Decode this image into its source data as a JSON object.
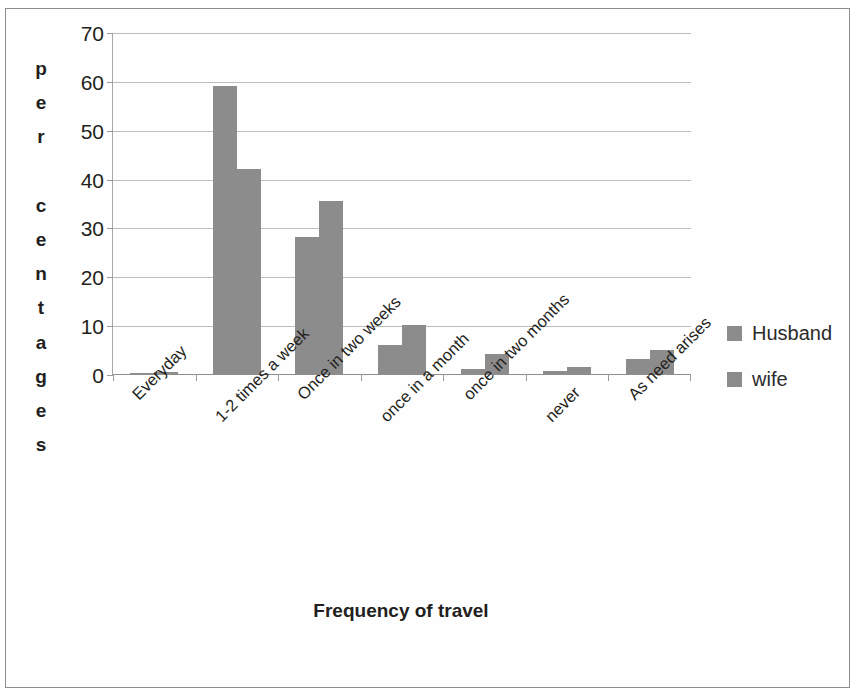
{
  "chart_data": {
    "type": "bar",
    "title": "",
    "xlabel": "Frequency of travel",
    "ylabel": "percentages",
    "ylabel_letters": "p\ne\nr\n \nc\ne\nn\nt\na\ng\ne\ns",
    "categories": [
      "Everyday",
      "1-2 times a week",
      "Once in two weeks",
      "once in a month",
      "once in two months",
      "never",
      "As need arises"
    ],
    "series": [
      {
        "name": "Husband",
        "values": [
          0.3,
          59,
          28,
          6,
          1,
          0.7,
          3
        ],
        "color": "#8c8c8c"
      },
      {
        "name": "wife",
        "values": [
          0.5,
          42,
          35.5,
          10,
          4,
          1.5,
          5
        ],
        "color": "#8c8c8c"
      }
    ],
    "ylim": [
      0,
      70
    ],
    "yticks": [
      0,
      10,
      20,
      30,
      40,
      50,
      60,
      70
    ],
    "ytick_labels": [
      "0",
      "10",
      "20",
      "30",
      "40",
      "50",
      "60",
      "70"
    ],
    "grid": true,
    "grid_axis": "y",
    "legend_position": "right",
    "bar_gap_ratio": 0.42,
    "background": "#ffffff",
    "gridline_color": "#bdbdbd",
    "axis_color": "#8f8f8f",
    "text_color": "#231f20"
  },
  "legend": {
    "items": [
      {
        "label": "Husband",
        "color": "#8c8c8c"
      },
      {
        "label": "wife",
        "color": "#8c8c8c"
      }
    ]
  }
}
